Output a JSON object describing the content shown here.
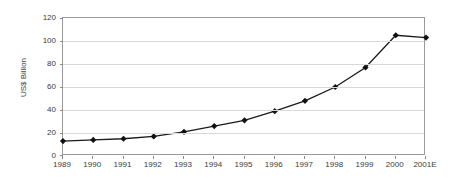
{
  "chart_data": {
    "type": "line",
    "title": "",
    "xlabel": "",
    "ylabel": "US$ Billion",
    "categories": [
      "1989",
      "1990",
      "1991",
      "1992",
      "1993",
      "1994",
      "1995",
      "1996",
      "1997",
      "1998",
      "1999",
      "2000",
      "2001E"
    ],
    "values": [
      13,
      14,
      15,
      17,
      21,
      26,
      31,
      39,
      48,
      60,
      77,
      105,
      103
    ],
    "ylim": [
      0,
      120
    ],
    "y_ticks": [
      "0",
      "20",
      "40",
      "60",
      "80",
      "100",
      "120"
    ],
    "y_tick_values": [
      0,
      20,
      40,
      60,
      80,
      100,
      120
    ],
    "grid": true,
    "legend": "none",
    "series_name": "",
    "marker": "diamond",
    "line_color": "#1a1a1a",
    "marker_color": "#111111",
    "grid_color": "#d9d9d9",
    "frame_color": "#9a9a9a",
    "background_color": "#ffffff",
    "text_color": "#3a3a3a"
  }
}
